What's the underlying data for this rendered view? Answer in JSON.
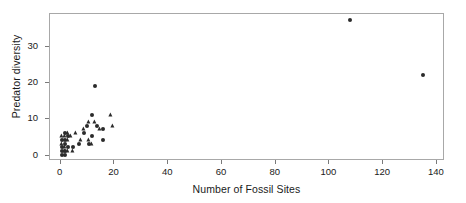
{
  "chart_data": {
    "type": "scatter",
    "title": "",
    "xlabel": "Number of Fossil Sites",
    "ylabel": "Predator diversity",
    "xlim": [
      -4,
      143
    ],
    "ylim": [
      -1.5,
      39
    ],
    "xticks": [
      0,
      20,
      40,
      60,
      80,
      100,
      120,
      140
    ],
    "xtick_labels": [
      "0",
      "20",
      "40",
      "60",
      "80",
      "100",
      "120",
      "140"
    ],
    "yticks": [
      0,
      10,
      20,
      30
    ],
    "ytick_labels": [
      "0",
      "10",
      "20",
      "30"
    ],
    "grid": false,
    "legend": "none",
    "marker_color": "#2b2b2b",
    "frame_color": "#a8a8a8",
    "series": [
      {
        "name": "circle-markers",
        "marker": "circle",
        "points": [
          [
            13,
            19
          ],
          [
            108,
            37
          ],
          [
            135,
            22
          ],
          [
            12,
            11
          ],
          [
            14,
            8
          ],
          [
            16,
            7
          ],
          [
            10,
            8
          ],
          [
            16,
            4
          ],
          [
            12,
            5
          ],
          [
            9,
            6
          ],
          [
            2,
            4
          ],
          [
            2,
            3
          ],
          [
            1,
            2
          ],
          [
            2,
            1
          ],
          [
            1,
            1
          ],
          [
            3,
            2
          ],
          [
            2,
            6
          ],
          [
            1,
            4
          ],
          [
            3,
            5
          ],
          [
            7,
            3
          ],
          [
            5,
            2
          ],
          [
            11,
            3
          ],
          [
            2,
            0
          ],
          [
            1,
            0
          ]
        ]
      },
      {
        "name": "triangle-markers",
        "marker": "triangle",
        "points": [
          [
            19,
            11
          ],
          [
            11,
            9
          ],
          [
            13,
            9
          ],
          [
            15,
            7
          ],
          [
            9,
            7
          ],
          [
            6,
            6
          ],
          [
            4,
            5
          ],
          [
            3,
            6
          ],
          [
            2,
            5
          ],
          [
            3,
            4
          ],
          [
            2,
            2
          ],
          [
            8,
            4
          ],
          [
            11,
            4
          ],
          [
            12,
            3
          ],
          [
            5,
            1
          ],
          [
            3,
            1
          ],
          [
            2,
            1
          ],
          [
            1,
            3
          ],
          [
            1,
            5
          ],
          [
            20,
            8
          ]
        ]
      }
    ]
  }
}
